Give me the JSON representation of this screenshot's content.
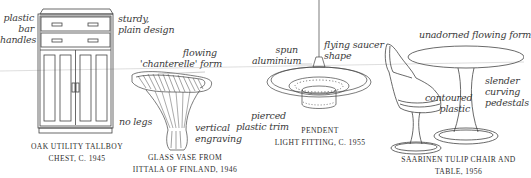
{
  "figure": {
    "background": "#ffffff",
    "ink_color": "#3a3a3a",
    "items": [
      {
        "id": "tallboy",
        "caption": [
          "OAK UTILITY TALLBOY",
          "CHEST, c. 1945"
        ],
        "annotations": {
          "left": [
            "plastic",
            "bar",
            "handles"
          ],
          "right": [
            "sturdy,",
            "plain design"
          ],
          "bottom": "no legs"
        }
      },
      {
        "id": "vase",
        "caption": [
          "GLASS VASE FROM",
          "IITTALA OF FINLAND, 1946"
        ],
        "annotations": {
          "top": [
            "flowing",
            "'chanterelle' form"
          ],
          "right": [
            "vertical",
            "engraving"
          ]
        }
      },
      {
        "id": "pendant",
        "caption": [
          "PENDENT",
          "LIGHT FITTING, c. 1955"
        ],
        "annotations": {
          "left": [
            "spun",
            "aluminium"
          ],
          "right": [
            "flying saucer",
            "shape"
          ],
          "bottom": [
            "pierced",
            "plastic trim"
          ]
        }
      },
      {
        "id": "tulip",
        "caption": [
          "SAARINEN TULIP CHAIR AND",
          "TABLE, 1956"
        ],
        "annotations": {
          "top": "unadorned flowing form",
          "middle": [
            "contoured",
            "plastic"
          ],
          "right": [
            "slender",
            "curving",
            "pedestals"
          ]
        }
      }
    ]
  }
}
